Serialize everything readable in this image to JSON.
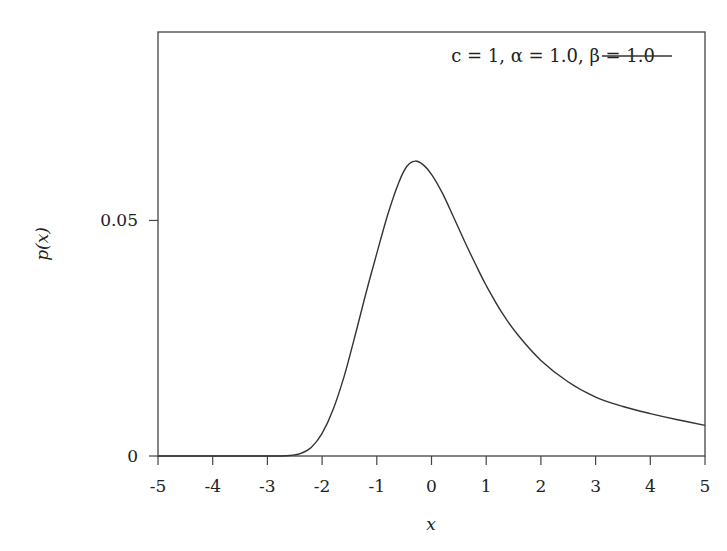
{
  "chart_data": {
    "type": "line",
    "title": "",
    "title_visibility": "clipped at top edge; text not legible",
    "xlabel": "x",
    "ylabel": "p(x)",
    "xlim": [
      -5,
      5
    ],
    "ylim": [
      0,
      0.09
    ],
    "x_ticks": [
      "-5",
      "-4",
      "-3",
      "-2",
      "-1",
      "0",
      "1",
      "2",
      "3",
      "4",
      "5"
    ],
    "y_ticks": [
      "0",
      "0.05"
    ],
    "grid": false,
    "legend_position": "top-right",
    "series": [
      {
        "name": "c = 1, α = 1.0, β = 1.0",
        "color": "#333333",
        "x": [
          -5,
          -3,
          -2.6,
          -2.4,
          -2.2,
          -2.0,
          -1.8,
          -1.6,
          -1.4,
          -1.2,
          -1.0,
          -0.8,
          -0.6,
          -0.45,
          -0.3,
          -0.15,
          0,
          0.2,
          0.4,
          0.6,
          0.8,
          1.0,
          1.3,
          1.6,
          2.0,
          2.5,
          3.0,
          3.5,
          4.0,
          4.5,
          5.0
        ],
        "y": [
          0,
          0,
          0.0001,
          0.0005,
          0.0018,
          0.0048,
          0.0098,
          0.0168,
          0.0254,
          0.0345,
          0.043,
          0.0512,
          0.058,
          0.0615,
          0.0626,
          0.0618,
          0.0598,
          0.0558,
          0.0508,
          0.0457,
          0.0408,
          0.0362,
          0.0302,
          0.0254,
          0.0203,
          0.0157,
          0.0125,
          0.0105,
          0.009,
          0.0077,
          0.0065
        ]
      }
    ]
  },
  "legend": {
    "entry_label": "c = 1, α = 1.0, β = 1.0"
  }
}
